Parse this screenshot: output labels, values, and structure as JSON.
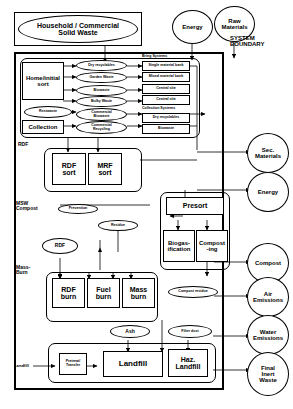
{
  "labels": {
    "system_boundary_line1": "SYSTEM",
    "system_boundary_line2": "BOUNDARY",
    "rdf_side": "RDF",
    "msw_side_line1": "MSW",
    "msw_side_line2": "Compost",
    "massburn_side_line1": "Mass-",
    "massburn_side_line2": "Burn",
    "landfill_side": "Landfill"
  },
  "inputs": {
    "solid_waste_line1": "Household / Commercial",
    "solid_waste_line2": "Solid  Waste",
    "energy": "Energy",
    "raw_materials_line1": "Raw",
    "raw_materials_line2": "Materials"
  },
  "sort_stage": {
    "home_sort_line1": "Home/initial",
    "home_sort_line2": "sort",
    "collection": "Collection",
    "restwaste": "Restwaste",
    "streams": [
      "Dry recyclables",
      "Garden Waste",
      "Biowaste",
      "Bulky Waste"
    ],
    "commercial_streams": [
      [
        "Commercial",
        "Biowaste"
      ],
      [
        "Commercial",
        "Recycling"
      ]
    ]
  },
  "bring_systems": {
    "heading": "Bring  Systems",
    "items": [
      "Single material bank",
      "Mixed material bank",
      "Central  site",
      "Central  site"
    ]
  },
  "collection_systems": {
    "heading": "Collection  Systems",
    "items": [
      "Dry recyclables",
      "Biowaste"
    ]
  },
  "rdf_stage": {
    "rdf_sort_line1": "RDF",
    "rdf_sort_line2": "sort",
    "mrf_sort_line1": "MRF",
    "mrf_sort_line2": "sort"
  },
  "compost_stage": {
    "presort": "Presort",
    "biogas_line1": "Biogas-",
    "biogas_line2": "ification",
    "compost_line1": "Compost",
    "compost_line2": "-ing",
    "prevention": "Prevention",
    "residue": "Residue",
    "compost_residue": "Compost  residue"
  },
  "burn_stage": {
    "rdf_ellipse": "RDF",
    "rdf_burn_line1": "RDF",
    "rdf_burn_line2": "burn",
    "fuel_burn_line1": "Fuel",
    "fuel_burn_line2": "burn",
    "mass_burn_line1": "Mass",
    "mass_burn_line2": "burn"
  },
  "landfill_stage": {
    "ash": "Ash",
    "filter_dust": "Filter  dust",
    "pretreat_line1": "Pretreat/",
    "pretreat_line2": "Transfer",
    "landfill": "Landfill",
    "haz_line1": "Haz.",
    "haz_line2": "Landfill"
  },
  "outputs": [
    {
      "line1": "Sec.",
      "line2": "Materials"
    },
    {
      "line1": "Energy",
      "line2": ""
    },
    {
      "line1": "Compost",
      "line2": ""
    },
    {
      "line1": "Air",
      "line2": "Emissions"
    },
    {
      "line1": "Water",
      "line2": "Emissions"
    },
    {
      "line1": "Final",
      "line2": "Inert",
      "line3": "Waste"
    }
  ],
  "colors": {
    "stroke": "#000000",
    "background": "#ffffff"
  }
}
